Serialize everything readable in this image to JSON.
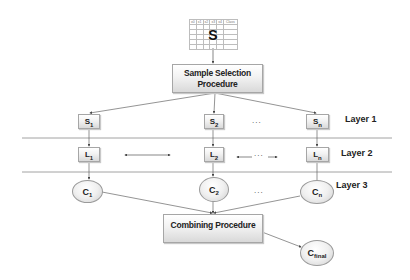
{
  "dataset": {
    "label": "S",
    "columns": [
      "x0",
      "x1",
      "x2",
      "x3",
      "x4",
      "Class"
    ]
  },
  "sample_selection": {
    "label": "Sample Selection Procedure"
  },
  "layers": [
    {
      "label": "Layer 1",
      "nodes": [
        {
          "base": "S",
          "sub": "1"
        },
        {
          "base": "S",
          "sub": "2"
        },
        {
          "base": "S",
          "sub": "n"
        }
      ],
      "ellipsis": "..."
    },
    {
      "label": "Layer 2",
      "nodes": [
        {
          "base": "L",
          "sub": "1"
        },
        {
          "base": "L",
          "sub": "2"
        },
        {
          "base": "L",
          "sub": "n"
        }
      ],
      "ellipsis": "..."
    },
    {
      "label": "Layer 3",
      "nodes": [
        {
          "base": "C",
          "sub": "1"
        },
        {
          "base": "C",
          "sub": "2"
        },
        {
          "base": "C",
          "sub": "n"
        }
      ],
      "ellipsis": "..."
    }
  ],
  "combining": {
    "label": "Combining Procedure"
  },
  "final": {
    "base": "C",
    "sub": "final"
  }
}
